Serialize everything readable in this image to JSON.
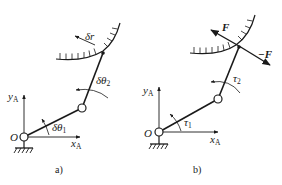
{
  "figure": {
    "panels": [
      {
        "id": "a",
        "caption": "a)",
        "origin_label": "O",
        "x_axis_label": "x",
        "x_axis_sub": "A",
        "y_axis_label": "y",
        "y_axis_sub": "A",
        "angle1_label": "δθ",
        "angle1_sub": "1",
        "angle2_label": "δθ",
        "angle2_sub": "2",
        "displacement_label": "δr"
      },
      {
        "id": "b",
        "caption": "b)",
        "origin_label": "O",
        "x_axis_label": "x",
        "x_axis_sub": "A",
        "y_axis_label": "y",
        "y_axis_sub": "A",
        "torque1_label": "τ",
        "torque1_sub": "1",
        "torque2_label": "τ",
        "torque2_sub": "2",
        "force_label": "F",
        "reaction_force_label": "−F"
      }
    ]
  }
}
